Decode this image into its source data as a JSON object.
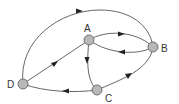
{
  "diagram": {
    "type": "directed-graph",
    "nodes": [
      {
        "id": "A",
        "label": "A"
      },
      {
        "id": "B",
        "label": "B"
      },
      {
        "id": "C",
        "label": "C"
      },
      {
        "id": "D",
        "label": "D"
      }
    ],
    "edges": [
      {
        "from": "A",
        "to": "B",
        "label": ""
      },
      {
        "from": "B",
        "to": "A",
        "label": ""
      },
      {
        "from": "A",
        "to": "C",
        "label": ""
      },
      {
        "from": "C",
        "to": "B",
        "label": ""
      },
      {
        "from": "C",
        "to": "D",
        "label": ""
      },
      {
        "from": "D",
        "to": "A",
        "label": ""
      },
      {
        "from": "D",
        "to": "B",
        "label": ""
      }
    ],
    "colors": {
      "node_fill": "#b8b8b8",
      "node_stroke": "#666666",
      "edge": "#555555",
      "arrow": "#222222"
    }
  }
}
